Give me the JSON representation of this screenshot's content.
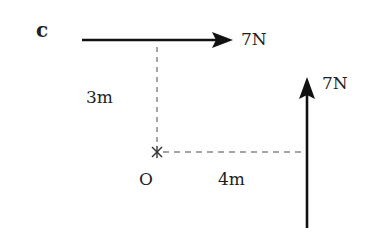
{
  "part_label": "c",
  "forces": [
    {
      "name": "top-force",
      "magnitude_label": "7N",
      "direction": "right"
    },
    {
      "name": "right-force",
      "magnitude_label": "7N",
      "direction": "up"
    }
  ],
  "distances": {
    "vertical": "3m",
    "horizontal": "4m"
  },
  "pivot": {
    "label": "O",
    "marker": "×"
  },
  "colors": {
    "arrow": "#111111",
    "dashed": "#888888",
    "text": "#1e1e1e"
  }
}
